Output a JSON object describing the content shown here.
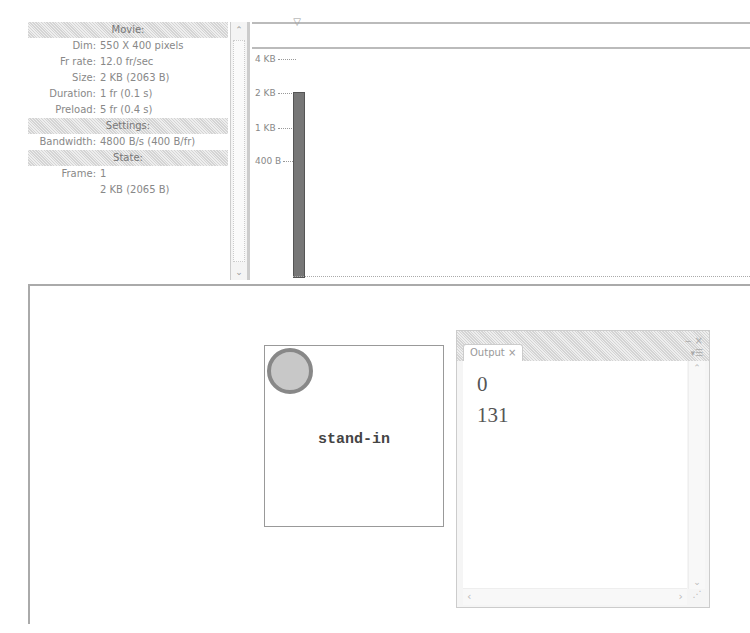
{
  "info_panel": {
    "movie_header": "Movie:",
    "movie": [
      {
        "label": "Dim:",
        "value": "550 X 400 pixels"
      },
      {
        "label": "Fr rate:",
        "value": "12.0 fr/sec"
      },
      {
        "label": "Size:",
        "value": "2 KB (2063 B)"
      },
      {
        "label": "Duration:",
        "value": "1 fr (0.1 s)"
      },
      {
        "label": "Preload:",
        "value": "5 fr (0.4 s)"
      }
    ],
    "settings_header": "Settings:",
    "settings": [
      {
        "label": "Bandwidth:",
        "value": "4800 B/s (400 B/fr)"
      }
    ],
    "state_header": "State:",
    "state": [
      {
        "label": "Frame:",
        "value": "1"
      },
      {
        "label": "",
        "value": "2 KB (2065 B)"
      }
    ],
    "scroll_up": "⌃",
    "scroll_down": "⌄"
  },
  "graph": {
    "playhead": "▽",
    "ticks": [
      {
        "label": "4 KB",
        "top": 54
      },
      {
        "label": "2 KB",
        "top": 88
      },
      {
        "label": "1 KB",
        "top": 123
      },
      {
        "label": "400 B",
        "top": 156
      }
    ],
    "bar": {
      "frame": 1,
      "bytes": 2065,
      "top": 92,
      "height": 184
    }
  },
  "stage": {
    "text": "stand-in"
  },
  "output": {
    "tab_label": "Output ×",
    "controls": "‒ ×",
    "menu": "▾☰",
    "lines": [
      "0",
      "131"
    ],
    "scroll_up": "⌃",
    "scroll_down": "⌄",
    "scroll_left": "‹",
    "scroll_right": "›",
    "grip": "⋰"
  }
}
